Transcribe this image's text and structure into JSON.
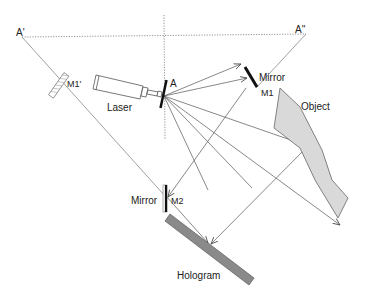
{
  "diagram": {
    "labels": {
      "a_prime": "A'",
      "a_double_prime": "A''",
      "a": "A",
      "laser": "Laser",
      "mirror1": "Mirror",
      "m1": "M1",
      "m1_prime": "M1'",
      "object": "Object",
      "mirror2": "Mirror",
      "m2": "M2",
      "hologram": "Hologram"
    },
    "colors": {
      "line": "#555555",
      "dotted": "#777777",
      "mirror": "#111111",
      "object_fill": "#d9d9d9",
      "hologram_fill": "#8a8a8a"
    }
  }
}
